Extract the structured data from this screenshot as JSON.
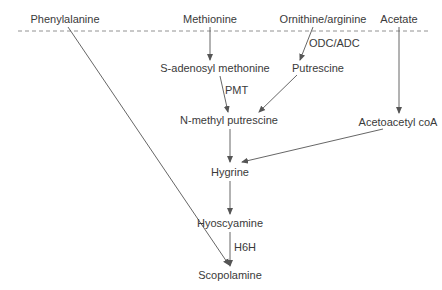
{
  "diagram": {
    "type": "biosynthesis-pathway",
    "colors": {
      "line": "#555555",
      "text": "#3a3a3a",
      "background": "#ffffff"
    },
    "divider": {
      "style": "dashed",
      "y": 31,
      "x1": 18,
      "x2": 428
    },
    "nodes": {
      "phenylalanine": {
        "label": "Phenylalanine",
        "x": 65,
        "y": 19
      },
      "methionine": {
        "label": "Methionine",
        "x": 210,
        "y": 19
      },
      "ornithine_arginine": {
        "label": "Ornithine/arginine",
        "x": 323,
        "y": 19
      },
      "acetate": {
        "label": "Acetate",
        "x": 399,
        "y": 19
      },
      "s_adenosyl_methonine": {
        "label": "S-adenosyl methonine",
        "x": 215,
        "y": 68
      },
      "putrescine": {
        "label": "Putrescine",
        "x": 318,
        "y": 68
      },
      "n_methyl_putrescine": {
        "label": "N-methyl putrescine",
        "x": 229,
        "y": 120
      },
      "acetoacetyl_coa": {
        "label": "Acetoacetyl coA",
        "x": 398,
        "y": 122
      },
      "hygrine": {
        "label": "Hygrine",
        "x": 230,
        "y": 172
      },
      "hyoscyamine": {
        "label": "Hyoscyamine",
        "x": 230,
        "y": 223
      },
      "scopolamine": {
        "label": "Scopolamine",
        "x": 230,
        "y": 275
      }
    },
    "enzymes": {
      "odc_adc": {
        "label": "ODC/ADC",
        "x": 309,
        "y": 43
      },
      "pmt": {
        "label": "PMT",
        "x": 225,
        "y": 90
      },
      "h6h": {
        "label": "H6H",
        "x": 234,
        "y": 247
      }
    },
    "edges": [
      {
        "from": "Phenylalanine",
        "to": "Scopolamine",
        "x1": 68,
        "y1": 27,
        "x2": 229,
        "y2": 265
      },
      {
        "from": "Methionine",
        "to": "S-adenosyl methonine",
        "x1": 210,
        "y1": 27,
        "x2": 210,
        "y2": 60
      },
      {
        "from": "Ornithine/arginine",
        "to": "Putrescine",
        "x1": 313,
        "y1": 27,
        "x2": 300,
        "y2": 60,
        "enzyme": "ODC/ADC"
      },
      {
        "from": "Acetate",
        "to": "Acetoacetyl coA",
        "x1": 399,
        "y1": 27,
        "x2": 399,
        "y2": 113
      },
      {
        "from": "S-adenosyl methonine",
        "to": "N-methyl putrescine",
        "x1": 220,
        "y1": 76,
        "x2": 228,
        "y2": 112,
        "enzyme": "PMT"
      },
      {
        "from": "Putrescine",
        "to": "N-methyl putrescine",
        "x1": 297,
        "y1": 75,
        "x2": 259,
        "y2": 112
      },
      {
        "from": "N-methyl putrescine",
        "to": "Hygrine",
        "x1": 230,
        "y1": 129,
        "x2": 230,
        "y2": 162
      },
      {
        "from": "Acetoacetyl coA",
        "to": "Hygrine",
        "x1": 383,
        "y1": 129,
        "x2": 242,
        "y2": 162
      },
      {
        "from": "Hygrine",
        "to": "Hyoscyamine",
        "x1": 230,
        "y1": 181,
        "x2": 230,
        "y2": 214
      },
      {
        "from": "Hyoscyamine",
        "to": "Scopolamine",
        "x1": 230,
        "y1": 232,
        "x2": 230,
        "y2": 266,
        "enzyme": "H6H"
      }
    ]
  }
}
